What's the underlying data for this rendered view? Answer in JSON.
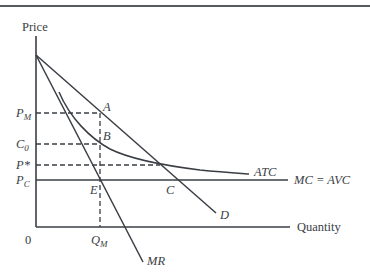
{
  "diagram": {
    "type": "economics-monopoly-natural",
    "axes": {
      "y_label": "Price",
      "x_label": "Quantity",
      "origin_label": "0"
    },
    "curves": {
      "demand": "D",
      "marginal_revenue": "MR",
      "average_total_cost": "ATC",
      "marginal_cost": "MC = AVC"
    },
    "price_levels": [
      {
        "id": "pm",
        "main": "P",
        "sub": "M"
      },
      {
        "id": "c0",
        "main": "C",
        "sub": "0"
      },
      {
        "id": "pstar",
        "main": "P*",
        "sub": ""
      },
      {
        "id": "pc",
        "main": "P",
        "sub": "C"
      }
    ],
    "quantity_levels": [
      {
        "id": "qm",
        "main": "Q",
        "sub": "M"
      }
    ],
    "points": [
      "A",
      "B",
      "C",
      "E"
    ],
    "colors": {
      "ink": "#3a3e44",
      "rule": "#555a60",
      "background": "#ffffff"
    }
  }
}
